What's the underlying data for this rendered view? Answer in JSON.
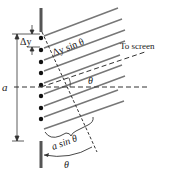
{
  "diagram": {
    "labels": {
      "delta_y": "Δy",
      "delta_y_sin": "Δy sin θ",
      "to_screen": "To screen",
      "theta_center": "θ",
      "theta_bottom": "θ",
      "a": "a",
      "a_sin": "a sin θ"
    },
    "colors": {
      "wall": "#555555",
      "ray": "#777777",
      "dot": "#111111",
      "dashed": "#333333",
      "text": "#222222"
    },
    "source_count": 8
  }
}
